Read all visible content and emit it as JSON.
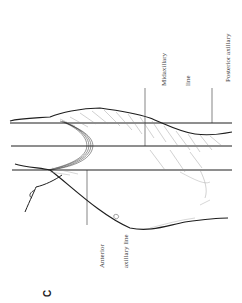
{
  "figure": {
    "letter": "C",
    "orientation": "rotated -90deg",
    "labels": {
      "anterior": {
        "line1": "Anterior",
        "line2": "axillary line"
      },
      "midaxillary": {
        "line1": "Midaxillary",
        "line2": "line"
      },
      "posterior": {
        "line1": "Posterior axillary",
        "line2": "line"
      }
    },
    "colors": {
      "ink": "#1e1e1e",
      "hatch": "#8a8a8a",
      "background": "#ffffff"
    }
  }
}
